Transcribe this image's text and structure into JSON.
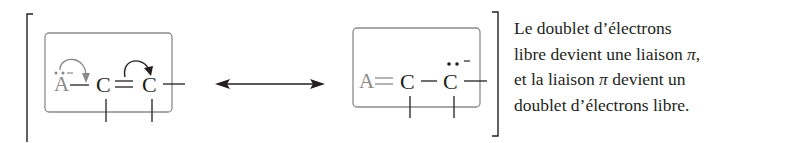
{
  "diagram": {
    "left_structure": {
      "atoms": [
        "A",
        "C",
        "C"
      ],
      "bonds": [
        "single",
        "double"
      ],
      "lone_pair_atom": "A",
      "charge_label": "−",
      "curved_arrows": [
        "lone pair on A to A–C bond",
        "C=C pi bond to terminal C"
      ]
    },
    "resonance_arrow": "double-headed-arrow",
    "right_structure": {
      "atoms": [
        "A",
        "C",
        "C"
      ],
      "bonds": [
        "double",
        "single"
      ],
      "lone_pair_atom": "C",
      "charge_label": "−"
    },
    "labels": {
      "left_A": "A",
      "left_C1": "C",
      "left_C2": "C",
      "right_A": "A",
      "right_C1": "C",
      "right_C2": "C",
      "left_charge": "−",
      "right_charge": "−"
    }
  },
  "caption": {
    "lines": [
      "Le doublet d’électrons",
      "libre devient une liaison ",
      ",",
      "et la liaison ",
      " devient un",
      "doublet d’électrons libre."
    ],
    "pi_symbol": "π"
  },
  "colors": {
    "ink": "#231f20",
    "grey_ink": "#8a8a8a",
    "box_stroke": "#8c8c8c"
  }
}
